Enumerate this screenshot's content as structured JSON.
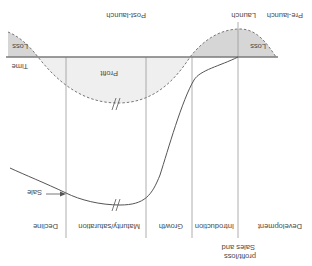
{
  "diagram": {
    "orientation": "rotated 180 degrees",
    "axis_labels": {
      "vertical": "Sales and profit/loss",
      "horizontal": "Time"
    },
    "period_labels": {
      "pre_launch": "Pre-launch",
      "launch": "Launch",
      "post_launch": "Post-launch"
    },
    "stages": [
      {
        "label": "Development"
      },
      {
        "label": "Introduction"
      },
      {
        "label": "Growth"
      },
      {
        "label": "Maturity/saturation"
      },
      {
        "label": "Decline"
      }
    ],
    "region_labels": {
      "loss_pre": "Loss",
      "profit": "Profit",
      "loss_decline": "Loss"
    },
    "curves": {
      "sales": {
        "label": "Sale",
        "style": "solid",
        "color": "#555555"
      },
      "profit": {
        "label": "Profit",
        "style": "dashed",
        "color": "#777777"
      }
    },
    "colors": {
      "loss_fill": "#d6d6d6",
      "profit_fill": "#efefef",
      "lines": "#8a8a8a",
      "text": "#4a4a4a"
    }
  }
}
